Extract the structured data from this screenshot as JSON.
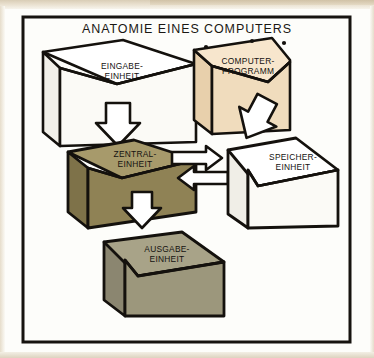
{
  "figure": {
    "title": "ANATOMIE EINES COMPUTERS",
    "kind": "isometric-block-diagram",
    "frame": {
      "border_color": "#16130f",
      "background": "#fdfdfa"
    }
  },
  "boxes": [
    {
      "id": "eingabe",
      "label_line1": "EINGABE-",
      "label_line2": "EINHEIT",
      "top_color": "#ffffff",
      "front_color": "#fbfaf6",
      "side_color": "#f2f0e9"
    },
    {
      "id": "computer-programm",
      "label_line1": "COMPUTER-",
      "label_line2": "PROGRAMM",
      "top_color": "#f7e6cd",
      "front_color": "#f0dcbd",
      "side_color": "#e8d0ac"
    },
    {
      "id": "zentral",
      "label_line1": "ZENTRAL-",
      "label_line2": "EINHEIT",
      "top_color": "#a79a6b",
      "front_color": "#8f8255",
      "side_color": "#7e7249"
    },
    {
      "id": "speicher",
      "label_line1": "SPEICHER-",
      "label_line2": "EINHEIT",
      "top_color": "#ffffff",
      "front_color": "#fbfaf6",
      "side_color": "#f0eee7"
    },
    {
      "id": "ausgabe",
      "label_line1": "AUSGABE-",
      "label_line2": "EINHEIT",
      "top_color": "#a8a388",
      "front_color": "#9c977c",
      "side_color": "#8b8670"
    }
  ],
  "arrows": [
    {
      "id": "eingabe-to-zentral",
      "direction": "down",
      "fill": "#ffffff",
      "stroke": "#14110d"
    },
    {
      "id": "programm-to-speicher",
      "direction": "down-left",
      "fill": "#ffffff",
      "stroke": "#14110d"
    },
    {
      "id": "zentral-to-speicher",
      "direction": "right",
      "fill": "#ffffff",
      "stroke": "#14110d"
    },
    {
      "id": "speicher-to-zentral",
      "direction": "left",
      "fill": "#ffffff",
      "stroke": "#14110d"
    },
    {
      "id": "zentral-to-ausgabe",
      "direction": "down",
      "fill": "#ffffff",
      "stroke": "#14110d"
    }
  ]
}
